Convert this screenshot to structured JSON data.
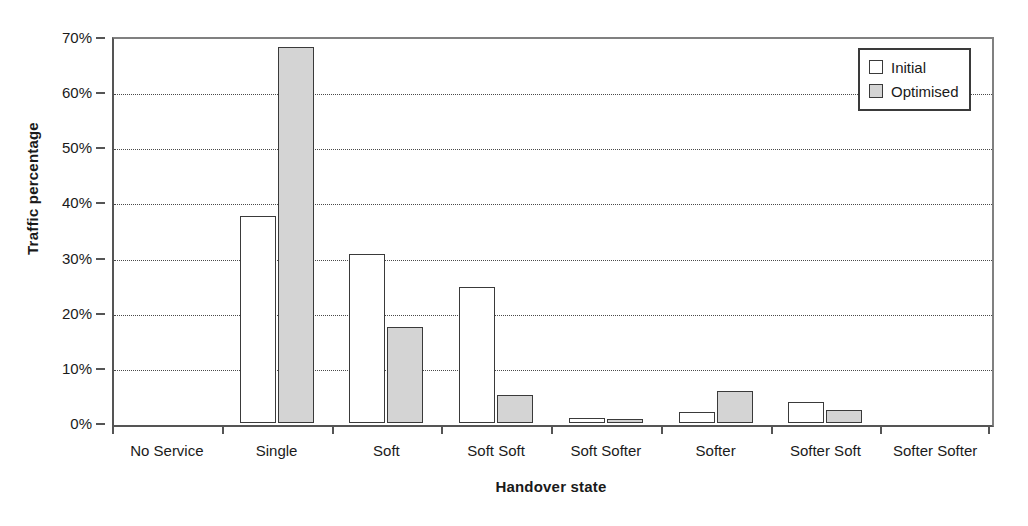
{
  "chart_data": {
    "type": "bar",
    "title": "",
    "xlabel": "Handover state",
    "ylabel": "Traffic percentage",
    "categories": [
      "No Service",
      "Single",
      "Soft",
      "Soft Soft",
      "Soft Softer",
      "Softer",
      "Softer Soft",
      "Softer Softer"
    ],
    "series": [
      {
        "name": "Initial",
        "color": "#ffffff",
        "values": [
          0,
          37.5,
          30.6,
          24.7,
          1.0,
          2.0,
          3.9,
          0
        ]
      },
      {
        "name": "Optimised",
        "color": "#d4d4d4",
        "values": [
          0,
          68.2,
          17.5,
          5.1,
          0.8,
          5.8,
          2.4,
          0
        ]
      }
    ],
    "ylim": [
      0,
      70
    ],
    "ytick_values": [
      0,
      10,
      20,
      30,
      40,
      50,
      60,
      70
    ],
    "ytick_labels": [
      "0%",
      "10%",
      "20%",
      "30%",
      "40%",
      "50%",
      "60%",
      "70%"
    ],
    "grid": true,
    "grid_axis": "y",
    "grid_style": "dotted",
    "legend_position": "top-right"
  },
  "legend": {
    "entries": [
      {
        "label": "Initial"
      },
      {
        "label": "Optimised"
      }
    ]
  },
  "axes": {
    "y_title": "Traffic percentage",
    "x_title": "Handover state"
  }
}
